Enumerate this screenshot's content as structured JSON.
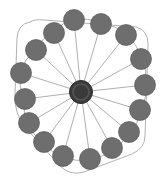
{
  "figure": {
    "title": "",
    "caption": "",
    "background_color": "#ffffff",
    "width": 165,
    "height": 182
  },
  "chart_data": {
    "type": "diagram",
    "diagram_kind": "node-link-graph",
    "topology": "star / hub-and-spoke with peripheral ring",
    "title": "",
    "xlabel": "",
    "ylabel": "",
    "grid": false,
    "legend": null,
    "annotations": [],
    "style": {
      "node_fill": "#6e6e6e",
      "node_stroke": "#5a5a5a",
      "hub_fill": "#3a3a3a",
      "hub_stroke": "#2a2a2a",
      "hub_inner_fill": "#555555",
      "edge_color": "#9a9a9a",
      "edge_width": 0.8,
      "frame_color": "#a8a8a8",
      "frame_width": 0.9,
      "background": "#ffffff"
    },
    "counts": {
      "total_nodes": 17,
      "peripheral_nodes": 16,
      "hub_nodes": 1,
      "spoke_edges": 16,
      "ring_edges": 16,
      "total_edges": 32
    },
    "hub": {
      "id": "hub",
      "label": "",
      "x": 81,
      "y": 92,
      "r": 11.5,
      "inner_r": 8.0,
      "degree": 16
    },
    "nodes": [
      {
        "id": "n1",
        "label": "",
        "x": 74,
        "y": 20,
        "r": 10.5,
        "degree": 3
      },
      {
        "id": "n2",
        "label": "",
        "x": 101,
        "y": 24,
        "r": 10.5,
        "degree": 3
      },
      {
        "id": "n3",
        "label": "",
        "x": 126,
        "y": 35,
        "r": 10.5,
        "degree": 3
      },
      {
        "id": "n4",
        "label": "",
        "x": 141,
        "y": 59,
        "r": 10.5,
        "degree": 3
      },
      {
        "id": "n5",
        "label": "",
        "x": 145,
        "y": 85,
        "r": 10.5,
        "degree": 3
      },
      {
        "id": "n6",
        "label": "",
        "x": 140,
        "y": 110,
        "r": 10.5,
        "degree": 3
      },
      {
        "id": "n7",
        "label": "",
        "x": 129,
        "y": 132,
        "r": 10.5,
        "degree": 3
      },
      {
        "id": "n8",
        "label": "",
        "x": 112,
        "y": 148,
        "r": 10.5,
        "degree": 3
      },
      {
        "id": "n9",
        "label": "",
        "x": 90,
        "y": 159,
        "r": 10.5,
        "degree": 3
      },
      {
        "id": "n10",
        "label": "",
        "x": 63,
        "y": 156,
        "r": 10.5,
        "degree": 3
      },
      {
        "id": "n11",
        "label": "",
        "x": 44,
        "y": 142,
        "r": 10.5,
        "degree": 3
      },
      {
        "id": "n12",
        "label": "",
        "x": 29,
        "y": 123,
        "r": 10.5,
        "degree": 3
      },
      {
        "id": "n13",
        "label": "",
        "x": 25,
        "y": 99,
        "r": 10.5,
        "degree": 3
      },
      {
        "id": "n14",
        "label": "",
        "x": 21,
        "y": 73,
        "r": 10.5,
        "degree": 3
      },
      {
        "id": "n15",
        "label": "",
        "x": 36,
        "y": 50,
        "r": 10.5,
        "degree": 3
      },
      {
        "id": "n16",
        "label": "",
        "x": 54,
        "y": 33,
        "r": 10.5,
        "degree": 3
      }
    ],
    "spoke_edges": [
      {
        "source": "hub",
        "target": "n1"
      },
      {
        "source": "hub",
        "target": "n2"
      },
      {
        "source": "hub",
        "target": "n3"
      },
      {
        "source": "hub",
        "target": "n4"
      },
      {
        "source": "hub",
        "target": "n5"
      },
      {
        "source": "hub",
        "target": "n6"
      },
      {
        "source": "hub",
        "target": "n7"
      },
      {
        "source": "hub",
        "target": "n8"
      },
      {
        "source": "hub",
        "target": "n9"
      },
      {
        "source": "hub",
        "target": "n10"
      },
      {
        "source": "hub",
        "target": "n11"
      },
      {
        "source": "hub",
        "target": "n12"
      },
      {
        "source": "hub",
        "target": "n13"
      },
      {
        "source": "hub",
        "target": "n14"
      },
      {
        "source": "hub",
        "target": "n15"
      },
      {
        "source": "hub",
        "target": "n16"
      }
    ],
    "ring_edges": [
      {
        "source": "n1",
        "target": "n2",
        "curve": 10
      },
      {
        "source": "n2",
        "target": "n3",
        "curve": 10
      },
      {
        "source": "n3",
        "target": "n4",
        "curve": 10
      },
      {
        "source": "n4",
        "target": "n5",
        "curve": 10
      },
      {
        "source": "n5",
        "target": "n6",
        "curve": 10
      },
      {
        "source": "n6",
        "target": "n7",
        "curve": 10
      },
      {
        "source": "n7",
        "target": "n8",
        "curve": 10
      },
      {
        "source": "n8",
        "target": "n9",
        "curve": 10
      },
      {
        "source": "n9",
        "target": "n10",
        "curve": 10
      },
      {
        "source": "n10",
        "target": "n11",
        "curve": 10
      },
      {
        "source": "n11",
        "target": "n12",
        "curve": 10
      },
      {
        "source": "n12",
        "target": "n13",
        "curve": 10
      },
      {
        "source": "n13",
        "target": "n14",
        "curve": 10
      },
      {
        "source": "n14",
        "target": "n15",
        "curve": 10
      },
      {
        "source": "n15",
        "target": "n16",
        "curve": 10
      },
      {
        "source": "n16",
        "target": "n1",
        "curve": 10
      }
    ],
    "frame": {
      "shape": "rounded-square",
      "description": "light gray rounded square outline enclosing the ring of nodes",
      "path": "M 30 22 Q 18 24 17 38 L 15 94 Q 14 112 24 126 L 60 166 Q 70 176 84 172 L 132 154 Q 145 148 145 136 L 148 44 Q 148 30 136 27 L 44 20 Q 34 19 30 22 Z"
    }
  }
}
